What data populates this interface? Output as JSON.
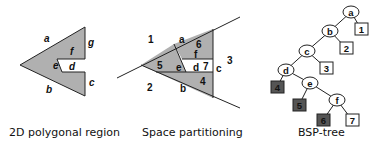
{
  "panels": [
    {
      "caption": "2D polygonal region",
      "edges": [
        "a",
        "b",
        "c",
        "d",
        "e",
        "f",
        "g"
      ]
    },
    {
      "caption": "Space partitioning",
      "regions": [
        "1",
        "2",
        "3",
        "4",
        "5",
        "6",
        "7"
      ],
      "lines": [
        "a",
        "b",
        "c",
        "d",
        "e",
        "f"
      ]
    },
    {
      "caption": "BSP-tree",
      "nodes": [
        "a",
        "b",
        "c",
        "d",
        "e",
        "f"
      ],
      "leaves": [
        "1",
        "2",
        "3",
        "4",
        "5",
        "6",
        "7"
      ]
    }
  ],
  "colors": {
    "fill_gray": "#b0b0b0",
    "leaf_dark": "#555555",
    "leaf_light": "#ffffff",
    "stroke": "#222222"
  }
}
